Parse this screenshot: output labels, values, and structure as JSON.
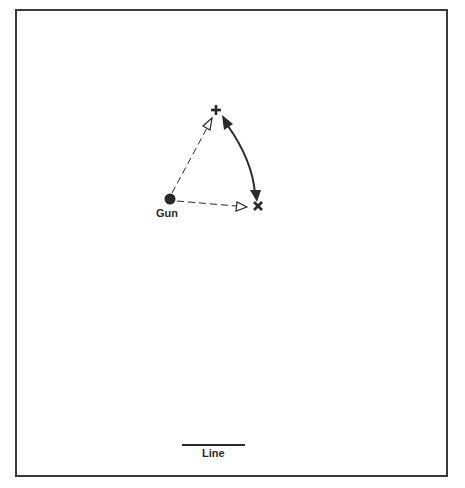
{
  "diagram": {
    "labels": {
      "gun": "Gun",
      "line": "Line"
    },
    "nodes": [
      {
        "id": "gun",
        "shape": "filled-circle",
        "x": 170,
        "y": 199
      },
      {
        "id": "plus",
        "shape": "plus-mark",
        "x": 216,
        "y": 110
      },
      {
        "id": "cross",
        "shape": "x-mark",
        "x": 258,
        "y": 206
      }
    ],
    "edges": [
      {
        "from": "gun",
        "to": "plus",
        "style": "dashed",
        "arrowhead": "open-triangle"
      },
      {
        "from": "gun",
        "to": "cross",
        "style": "dashed",
        "arrowhead": "open-triangle"
      },
      {
        "from": "plus",
        "to": "cross",
        "style": "solid-curved",
        "arrowhead": "filled-both-ends"
      }
    ],
    "line_marker": {
      "x1": 182,
      "x2": 245,
      "y": 445
    },
    "colors": {
      "ink": "#2a2a2a",
      "background": "#ffffff",
      "frame": "#3a3a3a"
    }
  }
}
